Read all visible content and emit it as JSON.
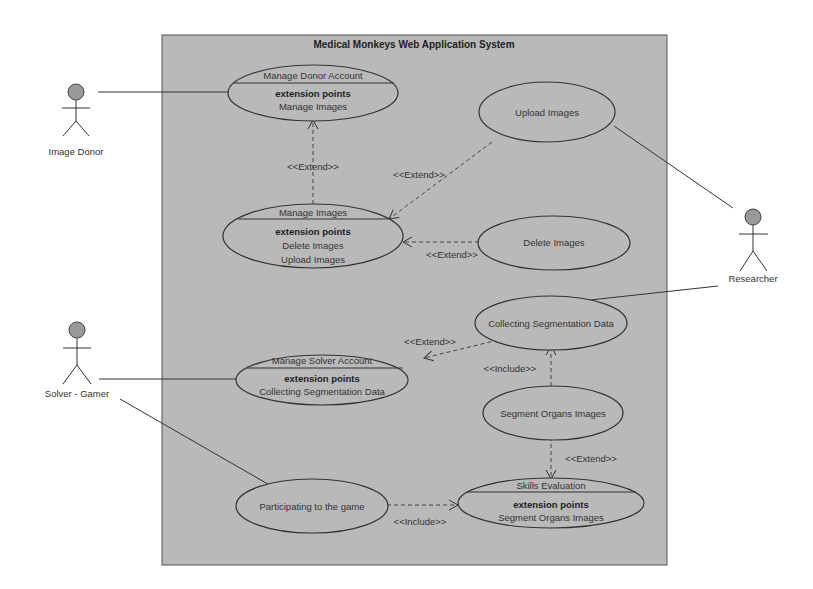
{
  "system": {
    "title": "Medical Monkeys Web Application System",
    "fill": "#b9b9b9",
    "border": "#555555"
  },
  "actors": [
    {
      "id": "image-donor",
      "label": "Image Donor"
    },
    {
      "id": "researcher",
      "label": "Researcher"
    },
    {
      "id": "solver-gamer",
      "label": "Solver - Gamer"
    }
  ],
  "use_cases": {
    "manage_donor_account": {
      "title": "Manage Donor Account",
      "ext_header": "extension points",
      "ext_points": [
        "Manage Images"
      ]
    },
    "upload_images": {
      "title": "Upload Images"
    },
    "manage_images": {
      "title": "Manage Images",
      "ext_header": "extension points",
      "ext_points": [
        "Delete Images",
        "Upload Images"
      ]
    },
    "delete_images": {
      "title": "Delete Images"
    },
    "collecting_segmentation_data": {
      "title": "Collecting Segmentation Data"
    },
    "manage_solver_account": {
      "title": "Manage Solver Account",
      "ext_header": "extension points",
      "ext_points": [
        "Collecting Segmentation Data"
      ]
    },
    "segment_organs_images": {
      "title": "Segment Organs Images"
    },
    "participating_game": {
      "title": "Participating to the game"
    },
    "skills_evaluation": {
      "title": "Skills Evaluation",
      "ext_header": "extension points",
      "ext_points": [
        "Segment Organs Images"
      ]
    }
  },
  "relations": {
    "extend_manage_images_to_donor": "<<Extend>>",
    "extend_upload_to_manage_images": "<<Extend>>",
    "extend_delete_to_manage_images": "<<Extend>>",
    "extend_collect_to_solver": "<<Extend>>",
    "include_segment_to_collect": "<<Include>>",
    "extend_segment_to_skills": "<<Extend>>",
    "include_game_to_skills": "<<Include>>"
  }
}
